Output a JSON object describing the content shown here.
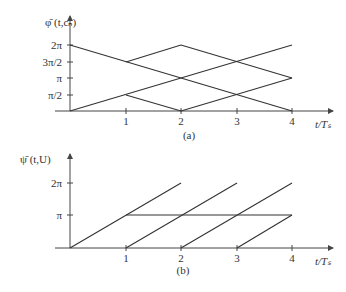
{
  "panel_a": {
    "ylabel": "φ̄ (t,cₙ)",
    "yticks": [
      "2π",
      "3π/2",
      "π",
      "π/2"
    ],
    "xticks": [
      "1",
      "2",
      "3",
      "4"
    ],
    "xlabel": "t/Tₛ",
    "caption": "(a)"
  },
  "panel_b": {
    "ylabel": "ψ̄ (t,U)",
    "yticks": [
      "2π",
      "π"
    ],
    "xticks": [
      "1",
      "2",
      "3",
      "4"
    ],
    "xlabel": "t/Tₛ",
    "caption": "(b)"
  }
}
